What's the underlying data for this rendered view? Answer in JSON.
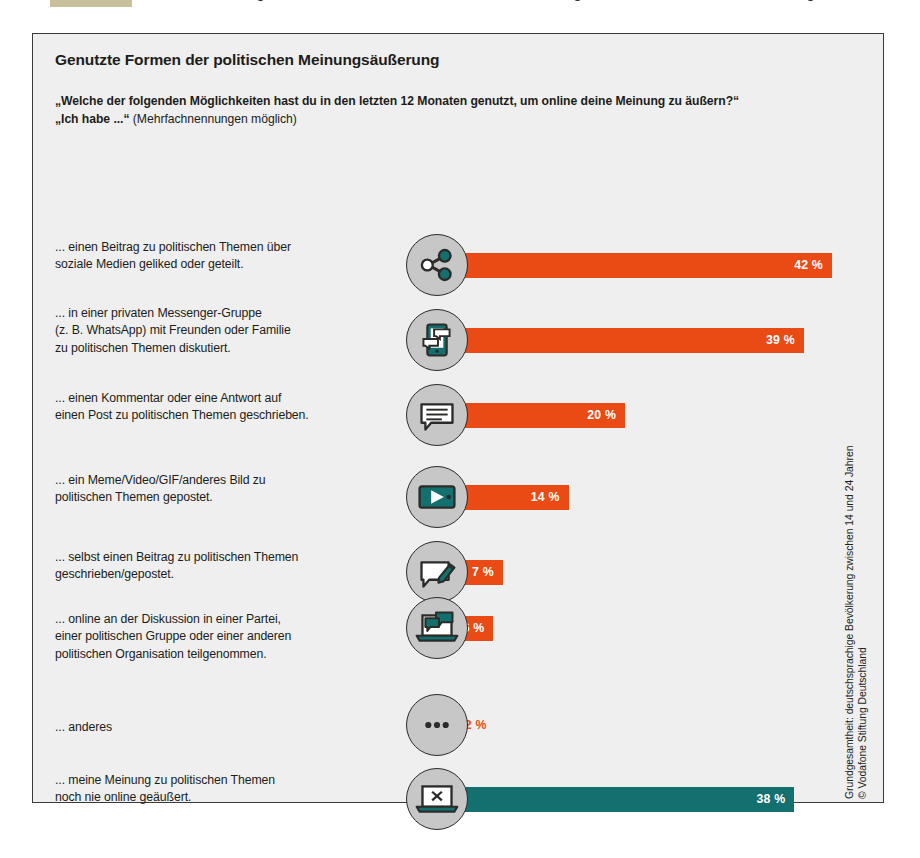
{
  "page": {
    "background_color": "#ffffff",
    "panel_background": "#eeefee",
    "panel_border_color": "#3a3a38"
  },
  "header": {
    "title": "Genutzte Formen der politischen Meinungsäußerung",
    "question": "„Welche der folgenden Möglichkeiten hast du in den letzten 12 Monaten genutzt, um online deine Meinung zu äußern?“",
    "answer_stem": "„Ich habe ...“",
    "answer_note": " (Mehrfachnennungen möglich)"
  },
  "colors": {
    "orange": "#ea4b14",
    "teal": "#14706e",
    "icon_badge": "#c6c7c6",
    "text": "#1d1d1b"
  },
  "source": {
    "line1": "Grundgesamtheit: deutschsprachige Bevölkerung zwischen 14 und 24 Jahren",
    "line2": "© Vodafone Stiftung Deutschland"
  },
  "chart_data": {
    "type": "bar",
    "orientation": "horizontal",
    "title": "Genutzte Formen der politischen Meinungsäußerung",
    "subtitle": "„Welche der folgenden Möglichkeiten hast du in den letzten 12 Monaten genutzt, um online deine Meinung zu äußern?“ „Ich habe ...“ (Mehrfachnennungen möglich)",
    "xlabel": "",
    "ylabel": "",
    "unit": "%",
    "xlim": [
      0,
      42
    ],
    "grid": false,
    "legend": "none",
    "value_suffix": " %",
    "categories": [
      "... einen Beitrag zu politischen Themen über soziale Medien geliked oder geteilt.",
      "... in einer privaten Messenger-Gruppe (z. B. WhatsApp) mit Freunden oder Familie zu politischen Themen diskutiert.",
      "... einen Kommentar oder eine Antwort auf einen Post zu politischen Themen geschrieben.",
      "... ein Meme/Video/GIF/anderes Bild zu politischen Themen gepostet.",
      "... selbst einen Beitrag zu politischen Themen geschrieben/gepostet.",
      "... online an der Diskussion in einer Partei, einer politischen Gruppe oder einer anderen politischen Organisation teilgenommen.",
      "... anderes",
      "... meine Meinung zu politischen Themen noch nie online geäußert."
    ],
    "values": [
      42,
      39,
      20,
      14,
      7,
      6,
      2,
      38
    ]
  },
  "rows": [
    {
      "id": "social-share",
      "label_lines": [
        "... einen Beitrag zu politischen Themen über",
        "soziale Medien geliked oder geteilt."
      ],
      "value": 42,
      "value_text": "42 %",
      "color_key": "orange",
      "label_position": "inside",
      "icon": "share-nodes-icon"
    },
    {
      "id": "messenger-group",
      "label_lines": [
        "... in einer privaten Messenger-Gruppe",
        "(z. B. WhatsApp) mit Freunden oder Familie",
        "zu politischen Themen diskutiert."
      ],
      "value": 39,
      "value_text": "39 %",
      "color_key": "orange",
      "label_position": "inside",
      "icon": "phone-messages-icon"
    },
    {
      "id": "comment-reply",
      "label_lines": [
        "... einen Kommentar oder eine Antwort auf",
        "einen Post zu politischen Themen geschrieben."
      ],
      "value": 20,
      "value_text": "20 %",
      "color_key": "orange",
      "label_position": "inside",
      "icon": "speech-bubble-icon"
    },
    {
      "id": "meme-video-gif",
      "label_lines": [
        "... ein Meme/Video/GIF/anderes Bild zu",
        "politischen Themen gepostet."
      ],
      "value": 14,
      "value_text": "14 %",
      "color_key": "orange",
      "label_position": "inside",
      "icon": "video-player-icon"
    },
    {
      "id": "own-post",
      "label_lines": [
        "... selbst einen Beitrag zu politischen Themen",
        "geschrieben/gepostet."
      ],
      "value": 7,
      "value_text": "7 %",
      "color_key": "orange",
      "label_position": "inside",
      "icon": "bubble-pencil-icon"
    },
    {
      "id": "party-discussion",
      "label_lines": [
        "... online an der Diskussion in einer Partei,",
        "einer politischen Gruppe oder einer anderen",
        "politischen Organisation teilgenommen."
      ],
      "value": 6,
      "value_text": "6 %",
      "color_key": "orange",
      "label_position": "inside",
      "icon": "laptop-bubble-icon"
    },
    {
      "id": "other",
      "label_lines": [
        "... anderes"
      ],
      "value": 2,
      "value_text": "2 %",
      "color_key": "orange",
      "label_position": "outside",
      "icon": "ellipsis-icon"
    },
    {
      "id": "never-expressed",
      "label_lines": [
        "... meine Meinung zu politischen Themen",
        "noch nie online geäußert."
      ],
      "value": 38,
      "value_text": "38 %",
      "color_key": "teal",
      "label_position": "inside",
      "icon": "laptop-x-icon"
    }
  ]
}
